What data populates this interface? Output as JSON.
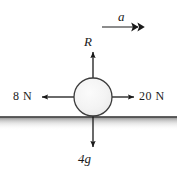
{
  "diagram": {
    "background_color": "#ffffff",
    "stroke_color": "#1a1a1a",
    "body": {
      "shape": "circle",
      "fill_color": "#f2f2f2",
      "outline_color": "#3c3c3c",
      "center_x": 93,
      "center_y": 97,
      "radius": 19
    },
    "ground": {
      "name": "ground-surface",
      "line_color": "#2b2b2b",
      "shadow_color": "#b9b9b9",
      "y": 117
    },
    "acceleration": {
      "label": "a",
      "arrow_style": "double-head",
      "direction": "right"
    },
    "forces": [
      {
        "id": "normal-reaction",
        "label": "R",
        "direction": "up",
        "italic": true
      },
      {
        "id": "applied-left",
        "label": "8 N",
        "direction": "left",
        "italic": false
      },
      {
        "id": "applied-right",
        "label": "20 N",
        "direction": "right",
        "italic": false
      },
      {
        "id": "weight",
        "label": "4g",
        "direction": "down",
        "italic": true
      }
    ]
  }
}
